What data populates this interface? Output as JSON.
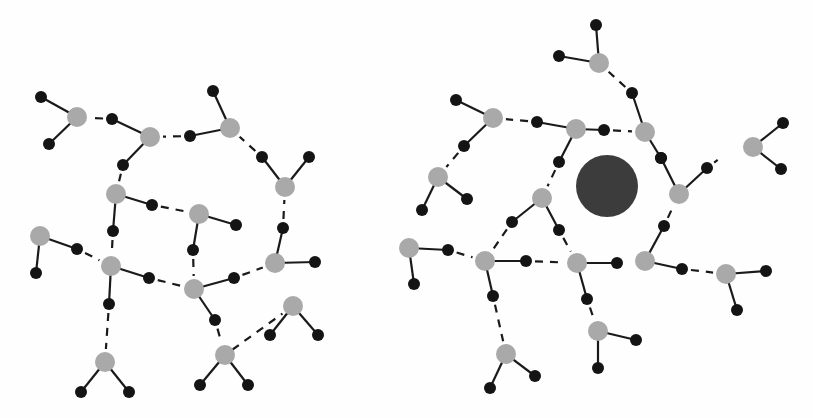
{
  "figure": {
    "colors": {
      "oxygen": "#a9a9a9",
      "hydrogen": "#141414",
      "bond": "#1a1a1a",
      "solute": "#3c3c3c",
      "background": "#fefefe"
    },
    "radii": {
      "oxygen": 10,
      "hydrogen": 6,
      "solute": 31
    }
  },
  "panels": [
    {
      "name": "left-network",
      "label": "Bulk water",
      "molecules": [
        {
          "o": [
            77,
            117
          ],
          "h": [
            [
              41,
              97
            ],
            [
              49,
              144
            ]
          ]
        },
        {
          "o": [
            150,
            137
          ],
          "h": [
            [
              112,
              119
            ],
            [
              123,
              165
            ]
          ]
        },
        {
          "o": [
            230,
            128
          ],
          "h": [
            [
              190,
              136
            ],
            [
              213,
              91
            ]
          ]
        },
        {
          "o": [
            285,
            187
          ],
          "h": [
            [
              262,
              157
            ],
            [
              309,
              157
            ]
          ]
        },
        {
          "o": [
            116,
            194
          ],
          "h": [
            [
              152,
              205
            ],
            [
              113,
              231
            ]
          ]
        },
        {
          "o": [
            199,
            214
          ],
          "h": [
            [
              236,
              225
            ],
            [
              193,
              250
            ]
          ]
        },
        {
          "o": [
            40,
            236
          ],
          "h": [
            [
              77,
              249
            ],
            [
              36,
              273
            ]
          ]
        },
        {
          "o": [
            111,
            266
          ],
          "h": [
            [
              149,
              278
            ],
            [
              109,
              304
            ]
          ]
        },
        {
          "o": [
            194,
            289
          ],
          "h": [
            [
              234,
              278
            ],
            [
              215,
              320
            ]
          ]
        },
        {
          "o": [
            275,
            263
          ],
          "h": [
            [
              283,
              228
            ],
            [
              315,
              262
            ]
          ]
        },
        {
          "o": [
            293,
            306
          ],
          "h": [
            [
              270,
              335
            ],
            [
              318,
              335
            ]
          ]
        },
        {
          "o": [
            105,
            362
          ],
          "h": [
            [
              81,
              392
            ],
            [
              129,
              392
            ]
          ]
        },
        {
          "o": [
            225,
            355
          ],
          "h": [
            [
              200,
              385
            ],
            [
              248,
              385
            ]
          ]
        }
      ],
      "hbonds": [
        [
          [
            112,
            119
          ],
          [
            77,
            117
          ]
        ],
        [
          [
            190,
            136
          ],
          [
            150,
            137
          ]
        ],
        [
          [
            262,
            157
          ],
          [
            230,
            128
          ]
        ],
        [
          [
            123,
            165
          ],
          [
            116,
            194
          ]
        ],
        [
          [
            152,
            205
          ],
          [
            199,
            214
          ]
        ],
        [
          [
            77,
            249
          ],
          [
            111,
            266
          ]
        ],
        [
          [
            113,
            231
          ],
          [
            111,
            266
          ]
        ],
        [
          [
            149,
            278
          ],
          [
            194,
            289
          ]
        ],
        [
          [
            193,
            250
          ],
          [
            194,
            289
          ]
        ],
        [
          [
            234,
            278
          ],
          [
            275,
            263
          ]
        ],
        [
          [
            283,
            228
          ],
          [
            285,
            187
          ]
        ],
        [
          [
            109,
            304
          ],
          [
            105,
            362
          ]
        ],
        [
          [
            215,
            320
          ],
          [
            225,
            355
          ]
        ],
        [
          [
            225,
            355
          ],
          [
            293,
            306
          ]
        ]
      ]
    },
    {
      "name": "right-network",
      "label": "Water around solute",
      "solute": {
        "center": [
          607,
          186
        ],
        "r": 31
      },
      "molecules": [
        {
          "o": [
            599,
            63
          ],
          "h": [
            [
              596,
              25
            ],
            [
              559,
              56
            ]
          ]
        },
        {
          "o": [
            493,
            118
          ],
          "h": [
            [
              456,
              100
            ],
            [
              464,
              146
            ]
          ]
        },
        {
          "o": [
            576,
            129
          ],
          "h": [
            [
              537,
              122
            ],
            [
              604,
              130
            ]
          ]
        },
        {
          "o": [
            645,
            132
          ],
          "h": [
            [
              632,
              93
            ],
            [
              661,
              158
            ]
          ]
        },
        {
          "o": [
            753,
            147
          ],
          "h": [
            [
              783,
              123
            ],
            [
              781,
              169
            ]
          ]
        },
        {
          "o": [
            679,
            194
          ],
          "h": [
            [
              707,
              168
            ],
            [
              661,
              158
            ]
          ]
        },
        {
          "o": [
            438,
            177
          ],
          "h": [
            [
              422,
              210
            ],
            [
              467,
              199
            ]
          ]
        },
        {
          "o": [
            542,
            198
          ],
          "h": [
            [
              512,
              222
            ],
            [
              559,
              230
            ]
          ]
        },
        {
          "o": [
            409,
            248
          ],
          "h": [
            [
              448,
              250
            ],
            [
              414,
              284
            ]
          ]
        },
        {
          "o": [
            485,
            261
          ],
          "h": [
            [
              526,
              261
            ],
            [
              493,
              296
            ]
          ]
        },
        {
          "o": [
            577,
            263
          ],
          "h": [
            [
              617,
              263
            ],
            [
              587,
              299
            ]
          ]
        },
        {
          "o": [
            645,
            261
          ],
          "h": [
            [
              664,
              226
            ],
            [
              682,
              269
            ]
          ]
        },
        {
          "o": [
            726,
            274
          ],
          "h": [
            [
              766,
              271
            ],
            [
              737,
              310
            ]
          ]
        },
        {
          "o": [
            598,
            331
          ],
          "h": [
            [
              636,
              340
            ],
            [
              598,
              368
            ]
          ]
        },
        {
          "o": [
            506,
            354
          ],
          "h": [
            [
              490,
              388
            ],
            [
              535,
              376
            ]
          ]
        }
      ],
      "extra_bonds": [
        [
          [
            576,
            129
          ],
          [
            559,
            162
          ]
        ]
      ],
      "extra_atoms": [
        [
          559,
          162
        ]
      ],
      "hbonds": [
        [
          [
            632,
            93
          ],
          [
            599,
            63
          ]
        ],
        [
          [
            537,
            122
          ],
          [
            493,
            118
          ]
        ],
        [
          [
            464,
            146
          ],
          [
            438,
            177
          ]
        ],
        [
          [
            559,
            162
          ],
          [
            542,
            198
          ]
        ],
        [
          [
            512,
            222
          ],
          [
            485,
            261
          ]
        ],
        [
          [
            448,
            250
          ],
          [
            485,
            261
          ]
        ],
        [
          [
            526,
            261
          ],
          [
            577,
            263
          ]
        ],
        [
          [
            559,
            230
          ],
          [
            577,
            263
          ]
        ],
        [
          [
            682,
            269
          ],
          [
            726,
            274
          ]
        ],
        [
          [
            587,
            299
          ],
          [
            598,
            331
          ]
        ],
        [
          [
            493,
            296
          ],
          [
            506,
            354
          ]
        ],
        [
          [
            707,
            168
          ],
          [
            728,
            152
          ]
        ],
        [
          [
            664,
            226
          ],
          [
            679,
            194
          ]
        ],
        [
          [
            604,
            130
          ],
          [
            645,
            132
          ]
        ]
      ]
    }
  ]
}
